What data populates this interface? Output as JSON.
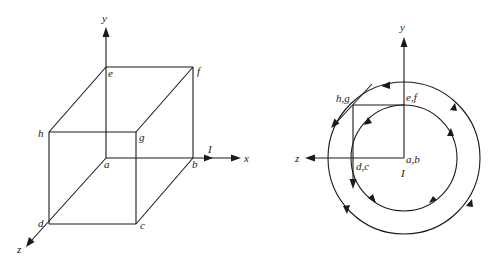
{
  "left_figure": {
    "description": "Rectangular loop cube with current I along x-axis",
    "axes": {
      "x": "x",
      "y": "y",
      "z": "z"
    },
    "vertices": {
      "a": "a",
      "b": "b",
      "c": "c",
      "d": "d",
      "e": "e",
      "f": "f",
      "g": "g",
      "h": "h"
    },
    "current_label": "I"
  },
  "right_figure": {
    "description": "End-on view with circular magnetic field lines around current I",
    "axes": {
      "y": "y",
      "z": "z"
    },
    "points": {
      "ab": "a,b",
      "ef": "e,f",
      "hg": "h,g",
      "dc": "d,c"
    },
    "current_label": "I"
  }
}
